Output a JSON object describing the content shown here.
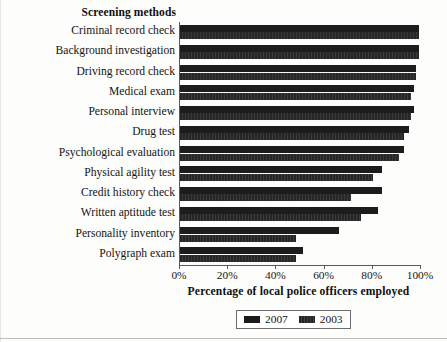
{
  "chart_data": {
    "type": "bar",
    "orientation": "horizontal",
    "title": "",
    "category_axis_title": "Screening methods",
    "xlabel": "Percentage of local police officers employed",
    "ylabel": "Screening methods",
    "xlim": [
      0,
      100
    ],
    "xticks": [
      0,
      20,
      40,
      60,
      80,
      100
    ],
    "xtick_labels": [
      "0%",
      "20%",
      "40%",
      "60%",
      "80%",
      "100%"
    ],
    "grid": false,
    "legend_position": "bottom-center",
    "categories": [
      "Criminal record check",
      "Background investigation",
      "Driving record check",
      "Medical exam",
      "Personal interview",
      "Drug test",
      "Psychological evaluation",
      "Physical agility test",
      "Credit history check",
      "Written aptitude test",
      "Personality inventory",
      "Polygraph exam"
    ],
    "series": [
      {
        "name": "2007",
        "color": "#1c1c1c",
        "values": [
          99,
          99,
          98,
          97,
          97,
          95,
          93,
          84,
          84,
          82,
          66,
          51
        ]
      },
      {
        "name": "2003",
        "color": "#2e2e2e",
        "values": [
          99,
          99,
          98,
          96,
          96,
          93,
          91,
          80,
          71,
          75,
          48,
          48
        ]
      }
    ]
  },
  "legend": {
    "entries": [
      {
        "label": "2007"
      },
      {
        "label": "2003"
      }
    ]
  },
  "colors": {
    "series_2007": "#1c1c1c",
    "series_2003": "#2e2e2e",
    "axis": "#5a5a5a",
    "text": "#141414",
    "background": "#fdfdfc"
  }
}
